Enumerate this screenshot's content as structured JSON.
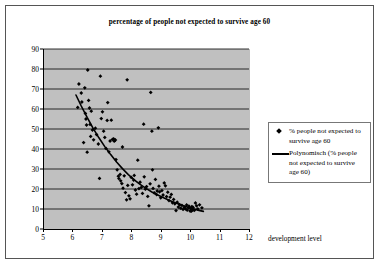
{
  "chart_data": {
    "type": "scatter",
    "title": "percentage of people not expected to survive age 60",
    "xlabel": "development level",
    "ylabel": "",
    "xlim": [
      5,
      12
    ],
    "ylim": [
      0,
      90
    ],
    "xticks": [
      5,
      6,
      7,
      8,
      9,
      10,
      11,
      12
    ],
    "yticks": [
      0,
      10,
      20,
      30,
      40,
      50,
      60,
      70,
      80,
      90
    ],
    "grid": "horizontal",
    "legend_position": "right",
    "plot_background": "#c0c0c0",
    "marker_color": "#000000",
    "trendline_color": "#000000",
    "series": [
      {
        "name": "% people not expected to survive age 60",
        "type": "scatter",
        "points": [
          [
            6.18,
            60.8
          ],
          [
            6.22,
            72.5
          ],
          [
            6.3,
            68.0
          ],
          [
            6.32,
            63.5
          ],
          [
            6.38,
            43.2
          ],
          [
            6.42,
            70.6
          ],
          [
            6.44,
            57.8
          ],
          [
            6.46,
            55.0
          ],
          [
            6.48,
            52.0
          ],
          [
            6.5,
            38.4
          ],
          [
            6.52,
            79.5
          ],
          [
            6.55,
            64.3
          ],
          [
            6.58,
            60.5
          ],
          [
            6.6,
            52.3
          ],
          [
            6.62,
            46.3
          ],
          [
            6.64,
            58.9
          ],
          [
            6.68,
            49.5
          ],
          [
            6.72,
            44.6
          ],
          [
            6.78,
            50.4
          ],
          [
            6.82,
            47.2
          ],
          [
            6.88,
            42.5
          ],
          [
            6.92,
            25.3
          ],
          [
            6.95,
            76.4
          ],
          [
            6.98,
            55.2
          ],
          [
            7.02,
            58.6
          ],
          [
            7.06,
            48.9
          ],
          [
            7.1,
            45.8
          ],
          [
            7.14,
            40.3
          ],
          [
            7.18,
            54.3
          ],
          [
            7.2,
            63.2
          ],
          [
            7.24,
            38.6
          ],
          [
            7.28,
            44.0
          ],
          [
            7.32,
            54.4
          ],
          [
            7.36,
            44.8
          ],
          [
            7.4,
            45.1
          ],
          [
            7.42,
            43.9
          ],
          [
            7.46,
            44.5
          ],
          [
            7.48,
            34.7
          ],
          [
            7.52,
            29.6
          ],
          [
            7.56,
            26.4
          ],
          [
            7.58,
            25.2
          ],
          [
            7.62,
            27.3
          ],
          [
            7.64,
            24.1
          ],
          [
            7.68,
            22.7
          ],
          [
            7.7,
            41.0
          ],
          [
            7.72,
            20.4
          ],
          [
            7.76,
            26.6
          ],
          [
            7.8,
            18.2
          ],
          [
            7.84,
            14.6
          ],
          [
            7.86,
            74.6
          ],
          [
            7.88,
            21.8
          ],
          [
            7.92,
            16.6
          ],
          [
            7.96,
            15.1
          ],
          [
            8.0,
            25.8
          ],
          [
            8.04,
            22.1
          ],
          [
            8.08,
            24.5
          ],
          [
            8.1,
            26.8
          ],
          [
            8.14,
            19.5
          ],
          [
            8.18,
            17.4
          ],
          [
            8.22,
            34.4
          ],
          [
            8.26,
            20.2
          ],
          [
            8.3,
            23.4
          ],
          [
            8.34,
            20.8
          ],
          [
            8.38,
            17.8
          ],
          [
            8.42,
            52.4
          ],
          [
            8.44,
            26.1
          ],
          [
            8.48,
            19.9
          ],
          [
            8.52,
            21.2
          ],
          [
            8.56,
            16.3
          ],
          [
            8.6,
            11.6
          ],
          [
            8.64,
            22.6
          ],
          [
            8.66,
            68.3
          ],
          [
            8.7,
            48.9
          ],
          [
            8.72,
            29.6
          ],
          [
            8.74,
            20.3
          ],
          [
            8.78,
            18.1
          ],
          [
            8.82,
            24.8
          ],
          [
            8.86,
            17.2
          ],
          [
            8.88,
            19.0
          ],
          [
            8.92,
            50.6
          ],
          [
            8.94,
            21.4
          ],
          [
            8.96,
            18.6
          ],
          [
            9.0,
            15.6
          ],
          [
            9.04,
            19.2
          ],
          [
            9.08,
            17.0
          ],
          [
            9.12,
            23.0
          ],
          [
            9.16,
            21.6
          ],
          [
            9.2,
            16.2
          ],
          [
            9.24,
            18.4
          ],
          [
            9.28,
            14.2
          ],
          [
            9.32,
            15.9
          ],
          [
            9.36,
            17.3
          ],
          [
            9.4,
            13.1
          ],
          [
            9.44,
            14.8
          ],
          [
            9.48,
            12.6
          ],
          [
            9.52,
            9.2
          ],
          [
            9.56,
            13.4
          ],
          [
            9.6,
            11.0
          ],
          [
            9.64,
            12.2
          ],
          [
            9.68,
            10.4
          ],
          [
            9.72,
            11.8
          ],
          [
            9.76,
            9.8
          ],
          [
            9.8,
            10.9
          ],
          [
            9.84,
            10.1
          ],
          [
            9.88,
            12.0
          ],
          [
            9.9,
            9.4
          ],
          [
            9.94,
            10.6
          ],
          [
            9.96,
            11.4
          ],
          [
            10.0,
            9.0
          ],
          [
            10.02,
            10.2
          ],
          [
            10.04,
            8.9
          ],
          [
            10.06,
            11.2
          ],
          [
            10.08,
            9.6
          ],
          [
            10.1,
            10.8
          ],
          [
            10.14,
            9.3
          ],
          [
            10.18,
            13.0
          ],
          [
            10.22,
            11.6
          ],
          [
            10.26,
            10.0
          ],
          [
            10.32,
            12.1
          ],
          [
            10.4,
            10.6
          ]
        ]
      },
      {
        "name": "Polynomisch (% people not expected to survive age 60)",
        "type": "trendline",
        "points": [
          [
            6.12,
            67.0
          ],
          [
            6.3,
            61.5
          ],
          [
            6.5,
            55.8
          ],
          [
            6.7,
            50.4
          ],
          [
            6.9,
            45.6
          ],
          [
            7.1,
            41.2
          ],
          [
            7.3,
            37.2
          ],
          [
            7.5,
            33.5
          ],
          [
            7.7,
            30.2
          ],
          [
            7.9,
            27.2
          ],
          [
            8.1,
            24.6
          ],
          [
            8.3,
            22.3
          ],
          [
            8.5,
            20.3
          ],
          [
            8.7,
            18.5
          ],
          [
            8.9,
            17.0
          ],
          [
            9.1,
            15.6
          ],
          [
            9.3,
            14.3
          ],
          [
            9.5,
            13.1
          ],
          [
            9.7,
            12.0
          ],
          [
            9.9,
            11.0
          ],
          [
            10.1,
            10.1
          ],
          [
            10.3,
            9.3
          ],
          [
            10.45,
            8.8
          ]
        ]
      }
    ]
  },
  "legend": {
    "entries": [
      {
        "label": "% people not expected to survive age 60",
        "marker": "diamond-marker"
      },
      {
        "label": "Polynomisch (% people not expected to survive age 60)",
        "marker": "line-marker"
      }
    ]
  }
}
